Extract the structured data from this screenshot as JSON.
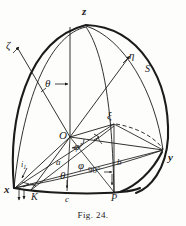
{
  "figure": {
    "caption_prefix": "F",
    "caption_smallcaps": "IG",
    "caption_suffix": ". 24.",
    "caption_full": "Fig. 24.",
    "ink_color": "#1b1b1b",
    "paper_color": "#fdfdfb",
    "type": "spherical-coordinate-geometry-diagram"
  },
  "axes": {
    "z": "z",
    "x": "x",
    "y": "y"
  },
  "direction_labels": {
    "zeta": "ζ",
    "eta": "η",
    "xi": "ξ",
    "s": "S"
  },
  "angles": {
    "theta_upper": "θ",
    "theta_lower": "θ",
    "phi_prime": "φ'",
    "phi": "φ",
    "right_angle": "90°"
  },
  "points": {
    "origin": "O",
    "k": "K",
    "c": "c",
    "p": "P",
    "a": "a",
    "b": "b",
    "i": "i",
    "i_subscript": "1"
  }
}
